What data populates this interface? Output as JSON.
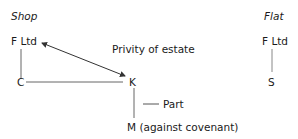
{
  "diagram": {
    "left": {
      "heading": "Shop",
      "nodes": {
        "f_ltd": "F Ltd",
        "c": "C",
        "k": "K",
        "m": "M (against covenant)"
      },
      "labels": {
        "privity": "Privity of estate",
        "part": "Part"
      }
    },
    "right": {
      "heading": "Flat",
      "nodes": {
        "f_ltd": "F Ltd",
        "s": "S"
      }
    },
    "colors": {
      "line": "#555555",
      "text": "#1a1a1a"
    }
  }
}
